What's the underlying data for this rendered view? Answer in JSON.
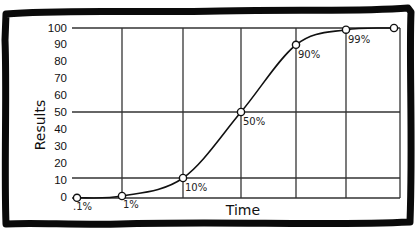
{
  "chart_data": {
    "type": "line",
    "title": "",
    "xlabel": "Time",
    "ylabel": "Results",
    "ylim": [
      0,
      100
    ],
    "yticks": [
      0,
      10,
      20,
      30,
      40,
      50,
      60,
      70,
      80,
      90,
      100
    ],
    "grid": {
      "horizontal_at": [
        0,
        10,
        50,
        100
      ],
      "vertical_count": 6
    },
    "legend": null,
    "series": [
      {
        "name": "Results",
        "points": [
          {
            "x": 0,
            "y": 0.1,
            "label": ".1%"
          },
          {
            "x": 1,
            "y": 1,
            "label": "1%"
          },
          {
            "x": 2,
            "y": 10,
            "label": "10%"
          },
          {
            "x": 3,
            "y": 50,
            "label": "50%"
          },
          {
            "x": 4,
            "y": 90,
            "label": "90%"
          },
          {
            "x": 5,
            "y": 99,
            "label": "99%"
          },
          {
            "x": 6,
            "y": 100,
            "label": ""
          }
        ]
      }
    ],
    "colors": {
      "line": "#111111",
      "grid": "#333333",
      "border": "#0a0a0a",
      "background": "#ffffff"
    }
  }
}
